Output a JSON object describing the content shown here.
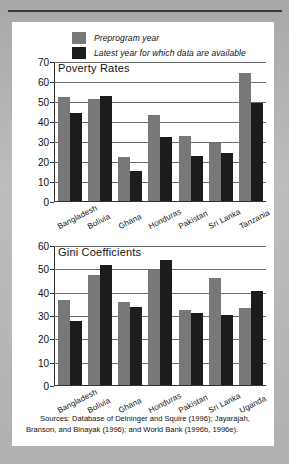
{
  "legend": {
    "items": [
      {
        "label": "Preprogram year",
        "color": "#787878",
        "key": "pre"
      },
      {
        "label": "Latest year for which data are available",
        "color": "#1c1c1c",
        "key": "post"
      }
    ]
  },
  "sources": {
    "line1": "Sources:  Database of Deininger and Squire (1996); Jayarajah,",
    "line2": "Branson, and Binayak (1996); and World Bank (1996b, 1996e)."
  },
  "chart_data": [
    {
      "type": "bar",
      "id": "poverty",
      "title": "Poverty Rates",
      "xlabel": "",
      "ylabel": "",
      "ylim": [
        0,
        70
      ],
      "yticks": [
        0,
        10,
        20,
        30,
        40,
        50,
        60,
        70
      ],
      "ytick_labels": [
        "0",
        "10",
        "20",
        "30",
        "40",
        "50",
        "60",
        "70"
      ],
      "grid": true,
      "legend_position": "above-figure",
      "categories": [
        "Bangladesh",
        "Bolivia",
        "Ghana",
        "Honduras",
        "Pakistan",
        "Sri Lanka",
        "Tanzania"
      ],
      "series": [
        {
          "name": "Preprogram year",
          "color": "#787878",
          "values": [
            52,
            51,
            22,
            43,
            32.5,
            29,
            64
          ]
        },
        {
          "name": "Latest year for which data are available",
          "color": "#1c1c1c",
          "values": [
            44,
            52.5,
            15,
            32,
            22.5,
            24,
            49
          ]
        }
      ]
    },
    {
      "type": "bar",
      "id": "gini",
      "title": "Gini Coefficients",
      "xlabel": "",
      "ylabel": "",
      "ylim": [
        0,
        60
      ],
      "yticks": [
        0,
        10,
        20,
        30,
        40,
        50,
        60
      ],
      "ytick_labels": [
        "0",
        "10",
        "20",
        "30",
        "40",
        "50",
        "60"
      ],
      "grid": true,
      "legend_position": "above-figure",
      "categories": [
        "Bangladesh",
        "Bolivia",
        "Ghana",
        "Honduras",
        "Pakistan",
        "Sri Lanka",
        "Uganda"
      ],
      "series": [
        {
          "name": "Preprogram year",
          "color": "#787878",
          "values": [
            36.5,
            47,
            35.5,
            49.5,
            32,
            46,
            33
          ]
        },
        {
          "name": "Latest year for which data are available",
          "color": "#1c1c1c",
          "values": [
            27.5,
            51.5,
            33.5,
            53.5,
            31,
            30,
            40.5
          ]
        }
      ]
    }
  ]
}
